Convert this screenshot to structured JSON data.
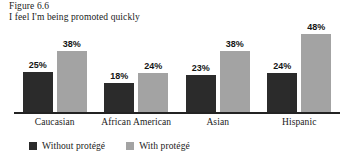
{
  "figure": {
    "label": "Figure 6.6",
    "title": "I feel I'm being promoted quickly"
  },
  "legend": {
    "items": [
      {
        "label": "Without protégé",
        "swatch": "dark-swatch-icon",
        "color": "#2b2b2b"
      },
      {
        "label": "With protégé",
        "swatch": "light-swatch-icon",
        "color": "#a3a3a3"
      }
    ]
  },
  "chart_data": {
    "type": "bar",
    "title": "I feel I'm being promoted quickly",
    "xlabel": "",
    "ylabel": "",
    "ylim": [
      0,
      52
    ],
    "grid": false,
    "legend_position": "bottom-left",
    "categories": [
      "Caucasian",
      "African American",
      "Asian",
      "Hispanic"
    ],
    "series": [
      {
        "name": "Without protégé",
        "color": "#2b2b2b",
        "values": [
          25,
          18,
          23,
          24
        ],
        "labels": [
          "25%",
          "18%",
          "23%",
          "24%"
        ]
      },
      {
        "name": "With protégé",
        "color": "#a3a3a3",
        "values": [
          38,
          24,
          38,
          48
        ],
        "labels": [
          "38%",
          "24%",
          "38%",
          "48%"
        ]
      }
    ]
  }
}
